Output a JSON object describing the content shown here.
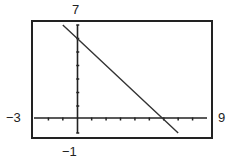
{
  "chart_data": {
    "type": "line",
    "title": "",
    "xlabel": "",
    "ylabel": "",
    "xlim": [
      -3,
      9
    ],
    "ylim": [
      -1,
      7
    ],
    "xscl": 1,
    "yscl": 1,
    "grid": false,
    "legend": null,
    "window_labels": {
      "xmin": "−3",
      "xmax": "9",
      "ymin": "−1",
      "ymax": "7"
    },
    "series": [
      {
        "name": "y = -x + 6",
        "x": [
          -1.0,
          0,
          1,
          2,
          3,
          4,
          5,
          6,
          7
        ],
        "y": [
          7.0,
          6,
          5,
          4,
          3,
          2,
          1,
          0,
          -1
        ]
      }
    ]
  },
  "labels": {
    "ymax": "7",
    "ymin": "−1",
    "xmin": "−3",
    "xmax": "9"
  },
  "colors": {
    "axis": "#222222",
    "frame": "#222222",
    "line": "#333333"
  }
}
